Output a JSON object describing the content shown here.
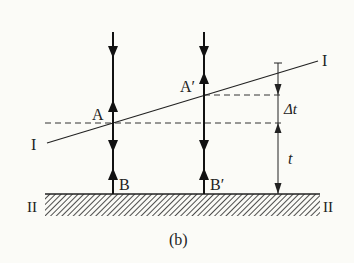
{
  "figure": {
    "caption": "(b)",
    "labels": {
      "line_I_left": "I",
      "line_I_right": "I",
      "ground_left": "II",
      "ground_right": "II",
      "point_A": "A",
      "point_A_prime": "A′",
      "point_B": "B",
      "point_B_prime": "B′",
      "delta_t": "Δt",
      "t": "t"
    },
    "colors": {
      "ink": "#1f1f1f",
      "background": "#fbfbf7"
    }
  }
}
